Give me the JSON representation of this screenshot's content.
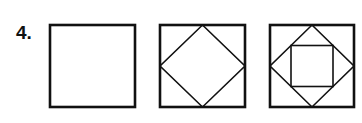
{
  "problem": {
    "number_label": "4.",
    "figures": [
      {
        "name": "plain-square",
        "description": "square"
      },
      {
        "name": "square-with-inscribed-diamond",
        "description": "square with rotated square connecting edge midpoints"
      },
      {
        "name": "square-with-diamond-and-inner-square",
        "description": "square with rotated square and inner axis-aligned square connecting diamond edge midpoints"
      }
    ],
    "stroke_color": "#111111",
    "background_color": "#ffffff"
  }
}
